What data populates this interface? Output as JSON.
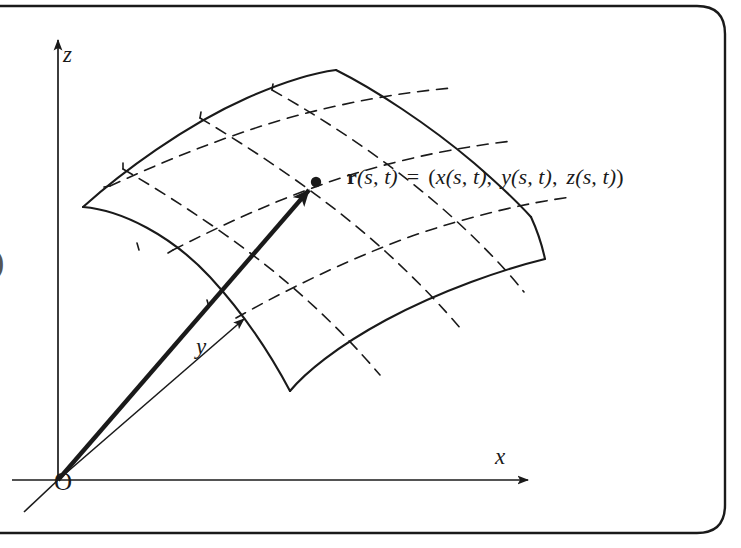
{
  "figure": {
    "kind": "parametric-surface-diagram",
    "caption_text": "",
    "background_color": "#ffffff",
    "stroke_color": "#1a1a1a",
    "width": 741,
    "height": 548
  },
  "border": {
    "style": "rounded-rect-partial",
    "corner_radius": 26,
    "stroke_color": "#1a1a1a",
    "stroke_width": 2
  },
  "axes": {
    "origin_label": "O",
    "items": [
      {
        "name": "z-axis",
        "label": "z",
        "direction": "up",
        "arrow": true
      },
      {
        "name": "y-axis",
        "label": "y",
        "direction": "up-right",
        "arrow": true
      },
      {
        "name": "x-axis",
        "label": "x",
        "direction": "right",
        "arrow": true
      }
    ]
  },
  "position_vector": {
    "name": "position-vector",
    "style": "thick-solid-arrow",
    "from": "O",
    "to": "point-on-surface"
  },
  "surface": {
    "name": "parametric-surface-patch",
    "boundary_style": "solid",
    "gridline_style": "dashed",
    "grid_divisions_s": 3,
    "grid_divisions_t": 3
  },
  "point_marker": {
    "name": "surface-point",
    "style": "filled-dot"
  },
  "formula": {
    "vector_symbol": "r",
    "parameters": "(s, t)",
    "equals": "=",
    "open_paren": "(",
    "components": [
      {
        "fn": "x",
        "args": "(s, t)"
      },
      {
        "fn": "y",
        "args": "(s, t)"
      },
      {
        "fn": "z",
        "args": "(s, t)"
      }
    ],
    "close_paren": ")",
    "separator": ",",
    "plain_text": "r(s, t) = (x(s, t),  y(s, t),  z(s, t))"
  },
  "edge_artifact": {
    "name": "page-edge-glyph",
    "text": ")"
  }
}
